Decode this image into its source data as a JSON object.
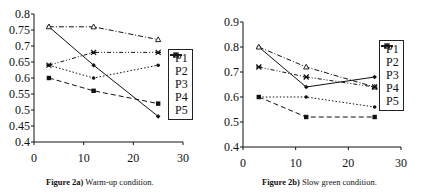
{
  "chart_data": [
    {
      "type": "line",
      "title": "Figure 2a) Warm-up condition.",
      "caption_label": "Figure 2a)",
      "caption_text": " Warm-up condition.",
      "xlabel": "",
      "ylabel": "",
      "xlim": [
        0,
        30
      ],
      "ylim": [
        0.4,
        0.8
      ],
      "xticks": [
        "0",
        "10",
        "20",
        "30"
      ],
      "yticks": [
        "0.4",
        "0.45",
        "0.5",
        "0.55",
        "0.6",
        "0.65",
        "0.7",
        "0.75",
        "0.8"
      ],
      "legend_position": "right",
      "grid": false,
      "x": [
        3,
        12,
        25
      ],
      "series": [
        {
          "name": "P1",
          "values": [
            0.76,
            0.64,
            0.48
          ]
        },
        {
          "name": "P2",
          "values": [
            0.6,
            0.56,
            0.52
          ]
        },
        {
          "name": "P3",
          "values": [
            0.64,
            0.6,
            0.64
          ]
        },
        {
          "name": "P4",
          "values": [
            0.76,
            0.76,
            0.72
          ]
        },
        {
          "name": "P5",
          "values": [
            0.64,
            0.68,
            0.68
          ]
        }
      ]
    },
    {
      "type": "line",
      "title": "Figure 2b) Slow green condition.",
      "caption_label": "Figure 2b)",
      "caption_text": " Slow green condition.",
      "xlabel": "",
      "ylabel": "",
      "xlim": [
        0,
        30
      ],
      "ylim": [
        0.4,
        0.9
      ],
      "xticks": [
        "0",
        "10",
        "20",
        "30"
      ],
      "yticks": [
        "0.4",
        "0.5",
        "0.6",
        "0.7",
        "0.8",
        "0.9"
      ],
      "legend_position": "right",
      "grid": false,
      "x": [
        3,
        12,
        25
      ],
      "series": [
        {
          "name": "P1",
          "values": [
            0.8,
            0.64,
            0.68
          ]
        },
        {
          "name": "P2",
          "values": [
            0.6,
            0.52,
            0.52
          ]
        },
        {
          "name": "P3",
          "values": [
            0.6,
            0.6,
            0.56
          ]
        },
        {
          "name": "P4",
          "values": [
            0.8,
            0.72,
            0.64
          ]
        },
        {
          "name": "P5",
          "values": [
            0.72,
            0.68,
            0.64
          ]
        }
      ]
    }
  ]
}
